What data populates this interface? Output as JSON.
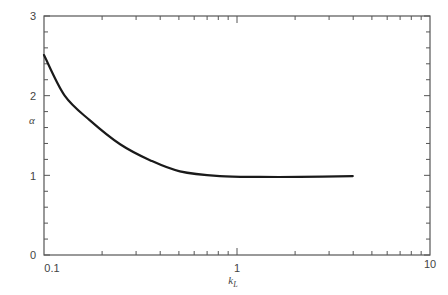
{
  "chart_data": {
    "type": "line",
    "title": "",
    "xlabel": "k_L",
    "ylabel": "α",
    "xscale": "log",
    "xlim": [
      0.1,
      10
    ],
    "ylim": [
      0,
      3
    ],
    "grid": false,
    "legend": null,
    "x_ticks": [
      {
        "value": 0.1,
        "label": "0.1"
      },
      {
        "value": 1,
        "label": "1"
      },
      {
        "value": 10,
        "label": "10"
      }
    ],
    "y_ticks": [
      {
        "value": 0,
        "label": "0"
      },
      {
        "value": 1,
        "label": "1"
      },
      {
        "value": 2,
        "label": "2"
      },
      {
        "value": 3,
        "label": "3"
      }
    ],
    "series": [
      {
        "name": "α vs k_L",
        "color": "#1a1a1a",
        "x": [
          0.1,
          0.128,
          0.173,
          0.248,
          0.354,
          0.506,
          0.815,
          1.31,
          2.11,
          3.98
        ],
        "y": [
          2.51,
          2.0,
          1.69,
          1.39,
          1.19,
          1.05,
          0.99,
          0.98,
          0.98,
          0.99
        ]
      }
    ]
  },
  "labels": {
    "x_axis": "k",
    "x_axis_sub": "L",
    "y_axis": "α",
    "x_tick_01": "0.1",
    "x_tick_1": "1",
    "x_tick_10": "10",
    "y_tick_0": "0",
    "y_tick_1": "1",
    "y_tick_2": "2",
    "y_tick_3": "3"
  }
}
